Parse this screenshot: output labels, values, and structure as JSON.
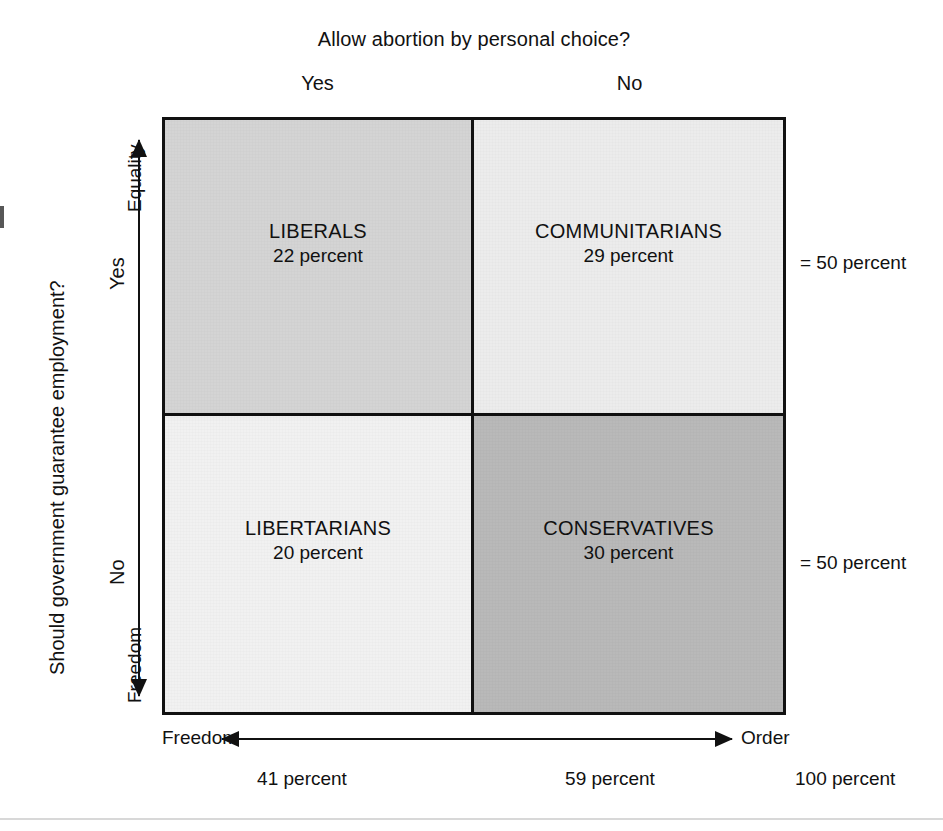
{
  "chart_data": {
    "type": "table",
    "title": "Allow abortion by personal choice?",
    "xlabel": "",
    "ylabel": "Should government guarantee employment?",
    "columns": [
      "Yes",
      "No"
    ],
    "rows": [
      "Yes",
      "No"
    ],
    "x_axis": {
      "left_end_label": "Freedom",
      "right_end_label": "Order",
      "column_totals": [
        "41 percent",
        "59 percent"
      ],
      "grand_total": "100 percent"
    },
    "y_axis": {
      "top_end_label": "Equality",
      "bottom_end_label": "Freedom",
      "row_totals": [
        "= 50 percent",
        "= 50 percent"
      ]
    },
    "cells": [
      {
        "position": "top-left",
        "name": "LIBERALS",
        "value": 22,
        "value_label": "22 percent",
        "color": "#d4d4d4"
      },
      {
        "position": "top-right",
        "name": "COMMUNITARIANS",
        "value": 29,
        "value_label": "29 percent",
        "color": "#ececec"
      },
      {
        "position": "bottom-left",
        "name": "LIBERTARIANS",
        "value": 20,
        "value_label": "20 percent",
        "color": "#f1f1f1"
      },
      {
        "position": "bottom-right",
        "name": "CONSERVATIVES",
        "value": 30,
        "value_label": "30 percent",
        "color": "#b9b9b9"
      }
    ],
    "legend": [],
    "grid": false
  },
  "figure": {
    "top_title": "Allow abortion by personal choice?",
    "side_question": "Should government guarantee employment?",
    "column_headers": {
      "yes": "Yes",
      "no": "No"
    },
    "row_headers": {
      "yes": "Yes",
      "no": "No"
    },
    "vertical_axis": {
      "top": "Equality",
      "bottom": "Freedom"
    },
    "horizontal_axis": {
      "left": "Freedom",
      "right": "Order"
    },
    "right_notes": {
      "top": "= 50 percent",
      "bottom": "= 50 percent"
    },
    "bottom_percents": {
      "left": "41 percent",
      "center": "59 percent",
      "right": "100 percent"
    },
    "quadrants": {
      "top_left": {
        "name": "LIBERALS",
        "percent": "22 percent"
      },
      "top_right": {
        "name": "COMMUNITARIANS",
        "percent": "29 percent"
      },
      "bottom_left": {
        "name": "LIBERTARIANS",
        "percent": "20 percent"
      },
      "bottom_right": {
        "name": "CONSERVATIVES",
        "percent": "30 percent"
      }
    },
    "colors": {
      "ink": "#111111",
      "top_left_fill": "#d4d4d4",
      "top_right_fill": "#ececec",
      "bottom_left_fill": "#f1f1f1",
      "bottom_right_fill": "#b9b9b9",
      "rule": "#d8d8d8"
    }
  }
}
